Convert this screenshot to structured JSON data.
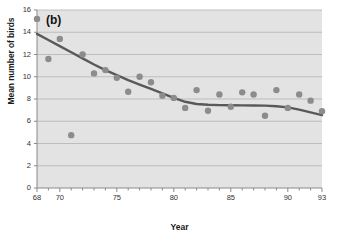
{
  "chart_data": {
    "type": "scatter",
    "title": "",
    "panel_label": "(b)",
    "xlabel": "Year",
    "ylabel": "Mean number of birds",
    "xlim": [
      68,
      93
    ],
    "ylim": [
      0,
      16
    ],
    "xticks_labeled": [
      68,
      70,
      75,
      80,
      85,
      90,
      93
    ],
    "xticks_minor_step": 1,
    "yticks": [
      0,
      2,
      4,
      6,
      8,
      10,
      12,
      14,
      16
    ],
    "grid": "horizontal",
    "plot_background": "#e3e3e3",
    "marker_color": "#8c8c8c",
    "line_color": "#595959",
    "series": [
      {
        "name": "Mean number of birds",
        "x": [
          68,
          69,
          70,
          71,
          72,
          73,
          74,
          75,
          76,
          77,
          78,
          79,
          80,
          81,
          82,
          83,
          84,
          85,
          86,
          87,
          88,
          89,
          90,
          91,
          92,
          93
        ],
        "values": [
          15.2,
          11.6,
          13.4,
          4.75,
          12.0,
          10.3,
          10.6,
          9.9,
          8.65,
          10.0,
          9.5,
          8.3,
          8.1,
          7.2,
          8.8,
          6.95,
          8.4,
          7.3,
          8.6,
          8.4,
          6.5,
          8.8,
          7.2,
          8.4,
          7.85,
          6.9
        ]
      }
    ],
    "trend_line": {
      "name": "smoothed trend",
      "x": [
        68,
        69,
        70,
        71,
        72,
        73,
        74,
        75,
        76,
        77,
        78,
        79,
        80,
        81,
        82,
        83,
        84,
        85,
        86,
        87,
        88,
        89,
        90,
        91,
        92,
        93
      ],
      "values": [
        13.85,
        13.3,
        12.75,
        12.2,
        11.65,
        11.1,
        10.6,
        10.15,
        9.7,
        9.3,
        8.9,
        8.5,
        8.1,
        7.75,
        7.55,
        7.48,
        7.45,
        7.44,
        7.43,
        7.42,
        7.4,
        7.35,
        7.25,
        7.05,
        6.8,
        6.55
      ]
    }
  }
}
